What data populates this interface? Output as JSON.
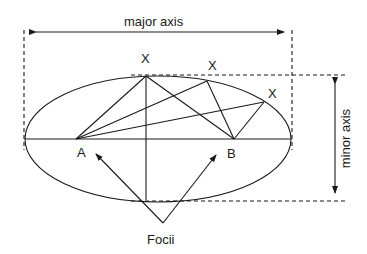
{
  "diagram": {
    "labels": {
      "major_axis": "major axis",
      "minor_axis": "minor axis",
      "focus_a": "A",
      "focus_b": "B",
      "foci": "Focii",
      "point_x1": "X",
      "point_x2": "X",
      "point_x3": "X"
    },
    "colors": {
      "stroke": "#1a1a1a",
      "background": "#ffffff"
    }
  }
}
